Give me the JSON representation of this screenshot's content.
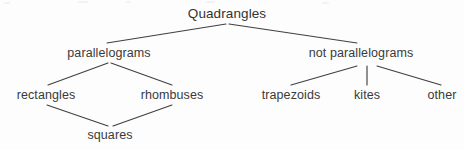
{
  "diagram": {
    "canvas": {
      "width": 464,
      "height": 149,
      "background": "#fdfdfd"
    },
    "line_color": "#404040",
    "text_color": "#3a3a3a",
    "nodes": [
      {
        "id": "quadrangles",
        "label": "Quadrangles",
        "x": 227,
        "y": 17,
        "level": 0
      },
      {
        "id": "parallelograms",
        "label": "parallelograms",
        "x": 109,
        "y": 56,
        "level": 1
      },
      {
        "id": "not-parallelograms",
        "label": "not parallelograms",
        "x": 361,
        "y": 56,
        "level": 1
      },
      {
        "id": "rectangles",
        "label": "rectangles",
        "x": 46,
        "y": 98,
        "level": 2
      },
      {
        "id": "rhombuses",
        "label": "rhombuses",
        "x": 172,
        "y": 98,
        "level": 2
      },
      {
        "id": "trapezoids",
        "label": "trapezoids",
        "x": 291,
        "y": 98,
        "level": 2
      },
      {
        "id": "kites",
        "label": "kites",
        "x": 367,
        "y": 98,
        "level": 2
      },
      {
        "id": "other",
        "label": "other",
        "x": 442,
        "y": 98,
        "level": 2
      },
      {
        "id": "squares",
        "label": "squares",
        "x": 110,
        "y": 138,
        "level": 3
      }
    ],
    "edges": [
      {
        "from": "quadrangles",
        "to": "parallelograms",
        "x1": 226,
        "y1": 24,
        "x2": 107,
        "y2": 43
      },
      {
        "from": "quadrangles",
        "to": "not-parallelograms",
        "x1": 229,
        "y1": 24,
        "x2": 357,
        "y2": 43
      },
      {
        "from": "parallelograms",
        "to": "rectangles",
        "x1": 108,
        "y1": 63,
        "x2": 48,
        "y2": 85
      },
      {
        "from": "parallelograms",
        "to": "rhombuses",
        "x1": 111,
        "y1": 63,
        "x2": 172,
        "y2": 85
      },
      {
        "from": "not-parallelograms",
        "to": "trapezoids",
        "x1": 357,
        "y1": 66,
        "x2": 291,
        "y2": 85
      },
      {
        "from": "not-parallelograms",
        "to": "kites",
        "x1": 367,
        "y1": 66,
        "x2": 367,
        "y2": 85
      },
      {
        "from": "not-parallelograms",
        "to": "other",
        "x1": 377,
        "y1": 66,
        "x2": 441,
        "y2": 85
      },
      {
        "from": "rectangles",
        "to": "squares",
        "x1": 47,
        "y1": 105,
        "x2": 108,
        "y2": 126
      },
      {
        "from": "rhombuses",
        "to": "squares",
        "x1": 172,
        "y1": 105,
        "x2": 113,
        "y2": 126
      }
    ],
    "artifacts": [
      {
        "x": 4,
        "y": 2,
        "w": 6
      },
      {
        "x": 78,
        "y": 1,
        "w": 10
      },
      {
        "x": 206,
        "y": 1,
        "w": 9
      },
      {
        "x": 322,
        "y": 2,
        "w": 7
      },
      {
        "x": 126,
        "y": 1,
        "w": 5
      }
    ]
  }
}
